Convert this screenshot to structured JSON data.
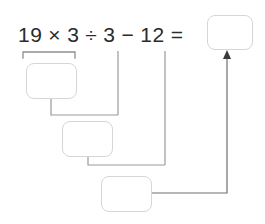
{
  "equation": {
    "tokens": [
      {
        "name": "operand-19",
        "text": "19"
      },
      {
        "name": "operator-times",
        "text": "×"
      },
      {
        "name": "operand-3a",
        "text": "3"
      },
      {
        "name": "operator-divide",
        "text": "÷"
      },
      {
        "name": "operand-3b",
        "text": "3"
      },
      {
        "name": "operator-minus",
        "text": "−"
      },
      {
        "name": "operand-12",
        "text": "12"
      },
      {
        "name": "operator-equals",
        "text": "="
      }
    ],
    "answer_box_value": ""
  },
  "steps": [
    {
      "name": "step-box-1",
      "value": ""
    },
    {
      "name": "step-box-2",
      "value": ""
    },
    {
      "name": "step-box-3",
      "value": ""
    }
  ],
  "colors": {
    "text": "#2b2b2b",
    "box_border": "#d6d6d6",
    "connector": "#8f8f8f",
    "bracket": "#8f8f8f",
    "arrow": "#3a3a3a",
    "background": "#ffffff"
  }
}
